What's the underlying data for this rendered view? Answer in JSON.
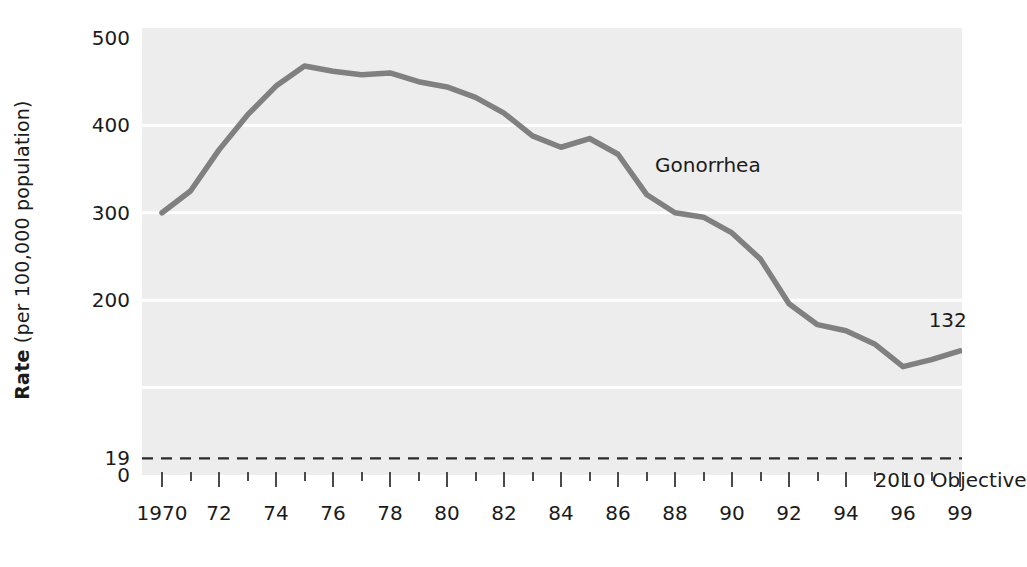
{
  "chart_data": {
    "type": "line",
    "title": "",
    "xlabel": "",
    "ylabel": "Rate (per 100,000 population)",
    "ylabel_bold_prefix": "Rate",
    "ylabel_rest": " (per 100,000 population)",
    "xlim": [
      1970,
      1999
    ],
    "ylim": [
      0,
      500
    ],
    "grid": true,
    "grid_color": "#ffffff",
    "plot_bg": "#ededed",
    "series_color": "#808080",
    "legend_position": "inline-annotation",
    "y_ticks": [
      {
        "value": 500,
        "label": "500"
      },
      {
        "value": 400,
        "label": "400"
      },
      {
        "value": 300,
        "label": "300"
      },
      {
        "value": 200,
        "label": "200"
      },
      {
        "value": 19,
        "label": "19"
      },
      {
        "value": 0,
        "label": "0"
      }
    ],
    "x_ticks": [
      {
        "value": 1970,
        "label": "1970",
        "major": true
      },
      {
        "value": 1971,
        "label": "",
        "major": false
      },
      {
        "value": 1972,
        "label": "72",
        "major": true
      },
      {
        "value": 1973,
        "label": "",
        "major": false
      },
      {
        "value": 1974,
        "label": "74",
        "major": true
      },
      {
        "value": 1975,
        "label": "",
        "major": false
      },
      {
        "value": 1976,
        "label": "76",
        "major": true
      },
      {
        "value": 1977,
        "label": "",
        "major": false
      },
      {
        "value": 1978,
        "label": "78",
        "major": true
      },
      {
        "value": 1979,
        "label": "",
        "major": false
      },
      {
        "value": 1980,
        "label": "80",
        "major": true
      },
      {
        "value": 1981,
        "label": "",
        "major": false
      },
      {
        "value": 1982,
        "label": "82",
        "major": true
      },
      {
        "value": 1983,
        "label": "",
        "major": false
      },
      {
        "value": 1984,
        "label": "84",
        "major": true
      },
      {
        "value": 1985,
        "label": "",
        "major": false
      },
      {
        "value": 1986,
        "label": "86",
        "major": true
      },
      {
        "value": 1987,
        "label": "",
        "major": false
      },
      {
        "value": 1988,
        "label": "88",
        "major": true
      },
      {
        "value": 1989,
        "label": "",
        "major": false
      },
      {
        "value": 1990,
        "label": "90",
        "major": true
      },
      {
        "value": 1991,
        "label": "",
        "major": false
      },
      {
        "value": 1992,
        "label": "92",
        "major": true
      },
      {
        "value": 1993,
        "label": "",
        "major": false
      },
      {
        "value": 1994,
        "label": "94",
        "major": true
      },
      {
        "value": 1995,
        "label": "",
        "major": false
      },
      {
        "value": 1996,
        "label": "96",
        "major": true
      },
      {
        "value": 1997,
        "label": "",
        "major": false
      },
      {
        "value": 1998,
        "label": "99",
        "major": true
      }
    ],
    "gridlines_y": [
      400,
      300,
      200,
      100
    ],
    "series": [
      {
        "name": "Gonorrhea",
        "x": [
          1970,
          1971,
          1972,
          1973,
          1974,
          1975,
          1976,
          1977,
          1978,
          1979,
          1980,
          1981,
          1982,
          1983,
          1984,
          1985,
          1986,
          1987,
          1988,
          1989,
          1990,
          1991,
          1992,
          1993,
          1994,
          1995,
          1996,
          1997,
          1998
        ],
        "values": [
          300,
          325,
          372,
          412,
          445,
          468,
          462,
          458,
          460,
          450,
          444,
          432,
          414,
          388,
          375,
          385,
          367,
          321,
          300,
          295,
          277,
          247,
          196,
          172,
          165,
          150,
          124,
          132,
          142
        ]
      }
    ],
    "objective_line": {
      "label": "2010 Objective",
      "value": 19,
      "style": "dashed"
    },
    "annotations": [
      {
        "name": "series-label",
        "text": "Gonorrhea",
        "x": 1987.3,
        "y": 352
      },
      {
        "name": "end-value-label",
        "text": "132",
        "x": 1996.9,
        "y": 175
      },
      {
        "name": "objective-label",
        "text": "2010 Objective",
        "x": 1995.0,
        "y": -8
      }
    ]
  }
}
